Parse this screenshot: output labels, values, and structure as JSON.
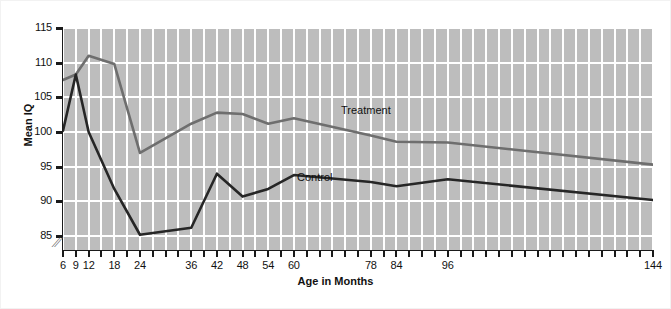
{
  "chart_data": {
    "type": "line",
    "title": "",
    "xlabel": "Age in Months",
    "ylabel": "Mean IQ",
    "xlim": [
      6,
      144
    ],
    "ylim": [
      83,
      115
    ],
    "grid": true,
    "axis_break": true,
    "legend_position": "inline-labels",
    "x_tick_labels": [
      "6",
      "9",
      "12",
      "18",
      "24",
      "36",
      "42",
      "48",
      "54",
      "60",
      "78",
      "84",
      "96",
      "144"
    ],
    "x_tick_values": [
      6,
      9,
      12,
      18,
      24,
      36,
      42,
      48,
      54,
      60,
      78,
      84,
      96,
      144
    ],
    "x_minor_ticks": [
      6,
      9,
      12,
      15,
      18,
      21,
      24,
      27,
      30,
      33,
      36,
      39,
      42,
      45,
      48,
      51,
      54,
      57,
      60,
      63,
      66,
      69,
      72,
      75,
      78,
      81,
      84,
      87,
      90,
      93,
      96,
      99,
      102,
      105,
      108,
      111,
      114,
      117,
      120,
      123,
      126,
      129,
      132,
      135,
      138,
      141,
      144
    ],
    "y_tick_labels": [
      "85",
      "90",
      "95",
      "100",
      "105",
      "110",
      "115"
    ],
    "y_tick_values": [
      85,
      90,
      95,
      100,
      105,
      110,
      115
    ],
    "series": [
      {
        "name": "Treatment",
        "color": "#6e6e6e",
        "x": [
          6,
          9,
          12,
          18,
          24,
          36,
          42,
          48,
          54,
          60,
          78,
          84,
          96,
          144
        ],
        "values": [
          107.5,
          108.3,
          111.0,
          109.8,
          97.0,
          101.2,
          102.8,
          102.6,
          101.2,
          102.0,
          99.5,
          98.6,
          98.5,
          95.3
        ]
      },
      {
        "name": "Control",
        "color": "#262626",
        "x": [
          6,
          9,
          12,
          18,
          24,
          36,
          42,
          48,
          54,
          60,
          78,
          84,
          96,
          144
        ],
        "values": [
          100.2,
          108.3,
          100.0,
          91.8,
          85.2,
          86.2,
          94.0,
          90.7,
          91.8,
          93.8,
          92.8,
          92.2,
          93.2,
          90.2
        ]
      }
    ],
    "annotations": [
      {
        "text": "Treatment",
        "x": 62,
        "y": 101
      },
      {
        "text": "Control",
        "x": 50,
        "y": 92.5
      }
    ]
  }
}
